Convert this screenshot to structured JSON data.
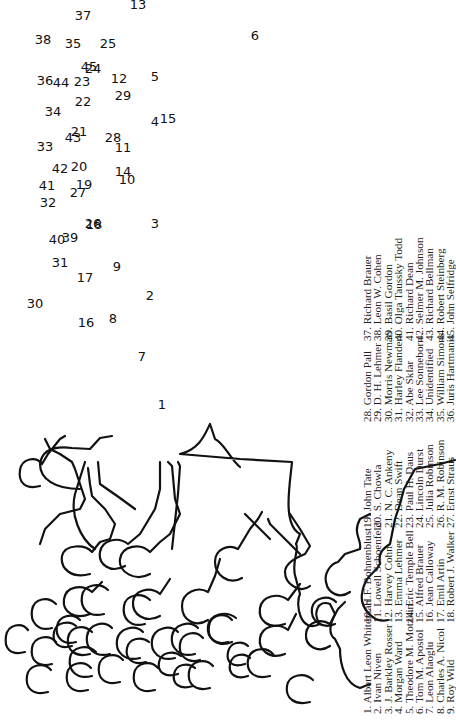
{
  "figure": {
    "type": "group-photo-key",
    "labels": [
      {
        "n": "1",
        "x": 162,
        "y": 404
      },
      {
        "n": "2",
        "x": 150,
        "y": 295
      },
      {
        "n": "3",
        "x": 155,
        "y": 223
      },
      {
        "n": "4",
        "x": 155,
        "y": 121
      },
      {
        "n": "5",
        "x": 155,
        "y": 76
      },
      {
        "n": "6",
        "x": 255,
        "y": 35
      },
      {
        "n": "7",
        "x": 142,
        "y": 356
      },
      {
        "n": "8",
        "x": 113,
        "y": 318
      },
      {
        "n": "9",
        "x": 117,
        "y": 266
      },
      {
        "n": "10",
        "x": 127,
        "y": 179
      },
      {
        "n": "11",
        "x": 123,
        "y": 147
      },
      {
        "n": "12",
        "x": 119,
        "y": 78
      },
      {
        "n": "13",
        "x": 138,
        "y": 4
      },
      {
        "n": "14",
        "x": 123,
        "y": 171
      },
      {
        "n": "15",
        "x": 168,
        "y": 118
      },
      {
        "n": "16",
        "x": 86,
        "y": 322
      },
      {
        "n": "17",
        "x": 85,
        "y": 277
      },
      {
        "n": "18",
        "x": 94,
        "y": 224
      },
      {
        "n": "19",
        "x": 84,
        "y": 184
      },
      {
        "n": "20",
        "x": 79,
        "y": 166
      },
      {
        "n": "21",
        "x": 79,
        "y": 131
      },
      {
        "n": "22",
        "x": 83,
        "y": 101
      },
      {
        "n": "23",
        "x": 82,
        "y": 81
      },
      {
        "n": "24",
        "x": 93,
        "y": 68
      },
      {
        "n": "25",
        "x": 108,
        "y": 43
      },
      {
        "n": "26",
        "x": 93,
        "y": 223
      },
      {
        "n": "27",
        "x": 78,
        "y": 192
      },
      {
        "n": "28",
        "x": 113,
        "y": 137
      },
      {
        "n": "29",
        "x": 123,
        "y": 95
      },
      {
        "n": "30",
        "x": 35,
        "y": 303
      },
      {
        "n": "31",
        "x": 60,
        "y": 262
      },
      {
        "n": "32",
        "x": 48,
        "y": 202
      },
      {
        "n": "33",
        "x": 45,
        "y": 146
      },
      {
        "n": "34",
        "x": 53,
        "y": 111
      },
      {
        "n": "35",
        "x": 73,
        "y": 43
      },
      {
        "n": "36",
        "x": 45,
        "y": 80
      },
      {
        "n": "37",
        "x": 83,
        "y": 15
      },
      {
        "n": "38",
        "x": 43,
        "y": 39
      },
      {
        "n": "39",
        "x": 70,
        "y": 237
      },
      {
        "n": "40",
        "x": 57,
        "y": 239
      },
      {
        "n": "41",
        "x": 47,
        "y": 185
      },
      {
        "n": "42",
        "x": 60,
        "y": 168
      },
      {
        "n": "43",
        "x": 73,
        "y": 137
      },
      {
        "n": "44",
        "x": 61,
        "y": 82
      },
      {
        "n": "45",
        "x": 89,
        "y": 66
      }
    ]
  },
  "legend": {
    "columns": [
      {
        "items": [
          "1. Albert Leon Whiteman",
          "2. Ivan Niven",
          "3. J. Barkley Rosser",
          "4. Morgan Ward",
          "5. Theodore M. Motzkin",
          "6. Tom M. Apostol",
          "7. Leon Alaoglu",
          "8. Charles A. Nicol",
          "9. Roy Wild"
        ]
      },
      {
        "items": [
          "10. H.F. Bohnenblust",
          "11. Lowell Schoenfeld",
          "12. Harvey Cohn",
          "13. Emma Lehmer",
          "14. Eric Temple Bell",
          "15. Alfred Brauer",
          "16. Jean Calloway",
          "17. Emil Artin",
          "18. Robert J. Walker"
        ]
      },
      {
        "items": [
          "19. John Tate",
          "20. S. Chowla",
          "21. N. C. Ankeny",
          "22. Dean Swift",
          "23. Paul H. Daus",
          "24. Lincoln Durst",
          "25. Julia Robinson",
          "26. R. M. Robinson",
          "27. Ernst Straus"
        ]
      },
      {
        "items": [
          "28. Gordon Pall",
          "29. D. H. Lehmer",
          "30. Morris Newman",
          "31. Harley Flanders",
          "32. Abe Sklar",
          "33. Lee Sonneborn",
          "34. Unidentified",
          "35. William Simons",
          "36. Juris Hartmanis"
        ]
      },
      {
        "items": [
          "37. Richard Brauer",
          "38. Leon W. Cohen",
          "39. Basil Gordon",
          "40. Olga Taussky Todd",
          "41. Richard Dean",
          "42. Selmer M. Johnson",
          "43. Richard Bellman",
          "44. Robert Steinberg",
          "45. John Selfridge"
        ]
      }
    ]
  },
  "colors": {
    "ink": "#111111",
    "text": "#222222",
    "background": "#ffffff"
  }
}
